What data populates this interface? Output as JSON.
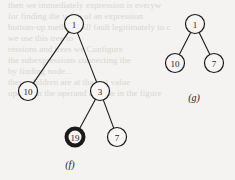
{
  "figure": {
    "trees": [
      {
        "label": "(f)",
        "nodes": [
          {
            "id": "f1",
            "value": "1",
            "x": 74,
            "y": 24,
            "highlight": false
          },
          {
            "id": "f10",
            "value": "10",
            "x": 28,
            "y": 91,
            "highlight": false
          },
          {
            "id": "f3",
            "value": "3",
            "x": 100,
            "y": 91,
            "highlight": false
          },
          {
            "id": "f19",
            "value": "19",
            "x": 75,
            "y": 137,
            "highlight": true
          },
          {
            "id": "f7",
            "value": "7",
            "x": 117,
            "y": 137,
            "highlight": false
          }
        ],
        "edges": [
          [
            "f1",
            "f10"
          ],
          [
            "f1",
            "f3"
          ],
          [
            "f3",
            "f19"
          ],
          [
            "f3",
            "f7"
          ]
        ],
        "label_pos": {
          "x": 70,
          "y": 168
        }
      },
      {
        "label": "(g)",
        "nodes": [
          {
            "id": "g1",
            "value": "1",
            "x": 195,
            "y": 24,
            "highlight": false
          },
          {
            "id": "g10",
            "value": "10",
            "x": 175,
            "y": 63,
            "highlight": false
          },
          {
            "id": "g7",
            "value": "7",
            "x": 214,
            "y": 63,
            "highlight": false
          }
        ],
        "edges": [
          [
            "g1",
            "g10"
          ],
          [
            "g1",
            "g7"
          ]
        ],
        "label_pos": {
          "x": 194,
          "y": 101
        }
      }
    ],
    "colors": {
      "background": "#f4f3f1",
      "ink": "#1a1a1a",
      "bleed": "#d8d6d3"
    }
  },
  "bleed_text": [
    "then we immediately expression is everyw",
    "for finding the value of an expression",
    "bottom-up method will fault legitimately to c",
    "              we use this tree to",
    "ressions and trees we Configure",
    "the subexpressions connecting the",
    "by finding node...",
    "these children are at the last value",
    "operation the operand at node in the figure",
    ""
  ]
}
